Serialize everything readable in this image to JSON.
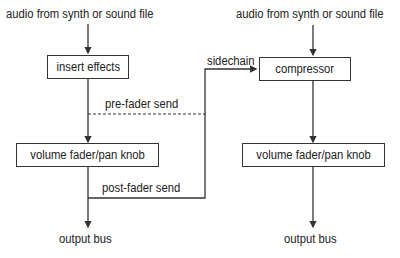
{
  "left_chain": {
    "input_label": "audio from synth or sound file",
    "insert_box": "insert effects",
    "pre_fader_label": "pre-fader send",
    "fader_box": "volume fader/pan knob",
    "post_fader_label": "post-fader send",
    "output_label": "output bus"
  },
  "right_chain": {
    "input_label": "audio from synth or sound file",
    "sidechain_label": "sidechain",
    "compressor_box": "compressor",
    "fader_box": "volume fader/pan knob",
    "output_label": "output bus"
  },
  "colors": {
    "line": "#333333",
    "background": "#ffffff"
  }
}
